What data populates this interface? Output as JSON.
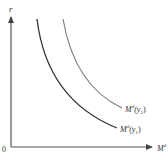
{
  "diagram": {
    "type": "money-demand-curves",
    "y_axis_label": "r",
    "x_axis_label": "M",
    "x_axis_label_superscript": "d",
    "origin_label": "0",
    "curves": [
      {
        "name": "Md(y1)",
        "label_base": "M",
        "label_sup": "d",
        "label_arg": "(y",
        "label_sub": "1",
        "label_close": ")",
        "color": "#333333"
      },
      {
        "name": "Md(y2)",
        "label_base": "M",
        "label_sup": "d",
        "label_arg": "(y",
        "label_sub": "2",
        "label_close": ")",
        "color": "#666666"
      }
    ]
  }
}
